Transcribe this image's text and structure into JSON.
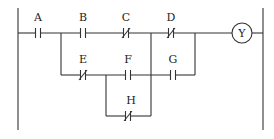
{
  "diagram": {
    "type": "ladder-logic",
    "contacts": [
      {
        "id": "A",
        "label": "A",
        "kind": "normally-open"
      },
      {
        "id": "B",
        "label": "B",
        "kind": "normally-open"
      },
      {
        "id": "C",
        "label": "C",
        "kind": "normally-closed"
      },
      {
        "id": "D",
        "label": "D",
        "kind": "normally-closed"
      },
      {
        "id": "E",
        "label": "E",
        "kind": "normally-closed"
      },
      {
        "id": "F",
        "label": "F",
        "kind": "normally-open"
      },
      {
        "id": "G",
        "label": "G",
        "kind": "normally-open"
      },
      {
        "id": "H",
        "label": "H",
        "kind": "normally-closed"
      }
    ],
    "coil": {
      "label": "Y"
    }
  }
}
